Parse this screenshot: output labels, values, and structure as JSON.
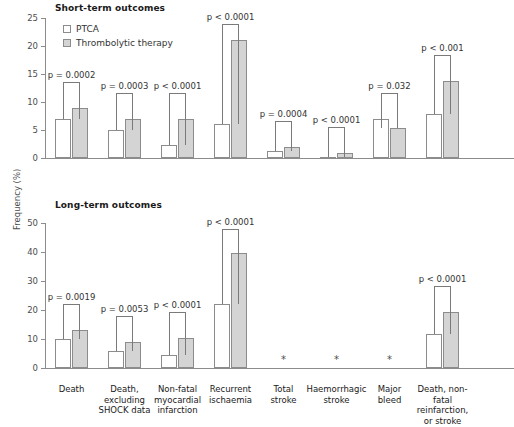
{
  "chart_data": {
    "type": "bar",
    "ylabel": "Frequency (%)",
    "xlabel": "",
    "legend_position": "top-left",
    "grid": false,
    "series_names": [
      "PTCA",
      "Thrombolytic therapy"
    ],
    "categories": [
      "Death",
      "Death, excluding SHOCK data",
      "Non-fatal myocardial infarction",
      "Recurrent ischaemia",
      "Total stroke",
      "Haemorrhagic stroke",
      "Major bleed",
      "Death, non-fatal reinfarction, or stroke"
    ],
    "panels": [
      {
        "title": "Short-term outcomes",
        "ylim": [
          0,
          25
        ],
        "yticks": [
          0,
          5,
          10,
          15,
          20,
          25
        ],
        "series": [
          {
            "name": "PTCA",
            "values": [
              7.0,
              5.0,
              2.4,
              6.0,
              1.2,
              0.2,
              6.9,
              7.9
            ]
          },
          {
            "name": "Thrombolytic therapy",
            "values": [
              9.0,
              7.0,
              7.0,
              21.0,
              2.0,
              0.9,
              5.3,
              13.8
            ]
          }
        ],
        "annotations": [
          {
            "category": "Death",
            "text": "p = 0.0002"
          },
          {
            "category": "Death, excluding SHOCK data",
            "text": "p = 0.0003"
          },
          {
            "category": "Non-fatal myocardial infarction",
            "text": "p < 0.0001"
          },
          {
            "category": "Recurrent ischaemia",
            "text": "p < 0.0001"
          },
          {
            "category": "Total stroke",
            "text": "p = 0.0004"
          },
          {
            "category": "Haemorrhagic stroke",
            "text": "p < 0.0001"
          },
          {
            "category": "Major bleed",
            "text": "p = 0.032"
          },
          {
            "category": "Death, non-fatal reinfarction, or stroke",
            "text": "p < 0.001"
          }
        ]
      },
      {
        "title": "Long-term outcomes",
        "ylim": [
          0,
          50
        ],
        "yticks": [
          0,
          10,
          20,
          30,
          40,
          50
        ],
        "series": [
          {
            "name": "PTCA",
            "values": [
              10.0,
              6.0,
              4.5,
              22.0,
              null,
              null,
              null,
              11.8
            ]
          },
          {
            "name": "Thrombolytic therapy",
            "values": [
              13.0,
              9.0,
              10.2,
              39.5,
              null,
              null,
              null,
              19.2
            ]
          }
        ],
        "annotations": [
          {
            "category": "Death",
            "text": "p = 0.0019"
          },
          {
            "category": "Death, excluding SHOCK data",
            "text": "p = 0.0053"
          },
          {
            "category": "Non-fatal myocardial infarction",
            "text": "p < 0.0001"
          },
          {
            "category": "Recurrent ischaemia",
            "text": "p < 0.0001"
          },
          {
            "category": "Death, non-fatal reinfarction, or stroke",
            "text": "p < 0.0001"
          }
        ],
        "no_data_marker": "*",
        "no_data_categories": [
          "Total stroke",
          "Haemorrhagic stroke",
          "Major bleed"
        ]
      }
    ]
  },
  "panel_top": {
    "title": "Short-term outcomes",
    "yticks": [
      "25",
      "20",
      "15",
      "10",
      "5",
      "0"
    ],
    "sig": [
      "p = 0.0002",
      "p = 0.0003",
      "p < 0.0001",
      "p < 0.0001",
      "p = 0.0004",
      "p < 0.0001",
      "p = 0.032",
      "p < 0.001"
    ]
  },
  "panel_bottom": {
    "title": "Long-term outcomes",
    "yticks": [
      "50",
      "40",
      "30",
      "20",
      "10",
      "0"
    ],
    "sig": [
      "p = 0.0019",
      "p = 0.0053",
      "p < 0.0001",
      "p < 0.0001",
      "p < 0.0001"
    ],
    "asterisk": "*"
  },
  "legend": {
    "ptca": "PTCA",
    "thrombolytic": "Thrombolytic therapy"
  },
  "axis": {
    "ylabel": "Frequency (%)"
  },
  "categories": [
    {
      "lines": [
        "Death"
      ]
    },
    {
      "lines": [
        "Death,",
        "excluding",
        "SHOCK data"
      ]
    },
    {
      "lines": [
        "Non-fatal",
        "myocardial",
        "infarction"
      ]
    },
    {
      "lines": [
        "Recurrent",
        "ischaemia"
      ]
    },
    {
      "lines": [
        "Total",
        "stroke"
      ]
    },
    {
      "lines": [
        "Haemorrhagic",
        "stroke"
      ]
    },
    {
      "lines": [
        "Major",
        "bleed"
      ]
    },
    {
      "lines": [
        "Death, non-fatal",
        "reinfarction,",
        "or stroke"
      ]
    }
  ]
}
